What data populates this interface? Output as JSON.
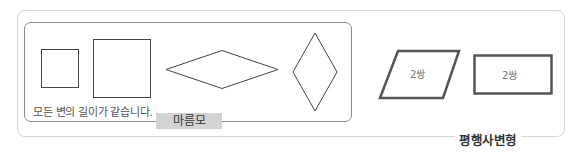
{
  "rhombus_group": {
    "caption": "모든 변의 길이가 같습니다.",
    "label": "마름모",
    "shapes": [
      "small-square",
      "large-square",
      "wide-rhombus",
      "tall-rhombus"
    ]
  },
  "parallelogram_group": {
    "label": "평행사변형",
    "shapes": [
      {
        "type": "slanted-parallelogram",
        "label": "2쌍"
      },
      {
        "type": "rectangle",
        "label": "2쌍"
      }
    ]
  }
}
